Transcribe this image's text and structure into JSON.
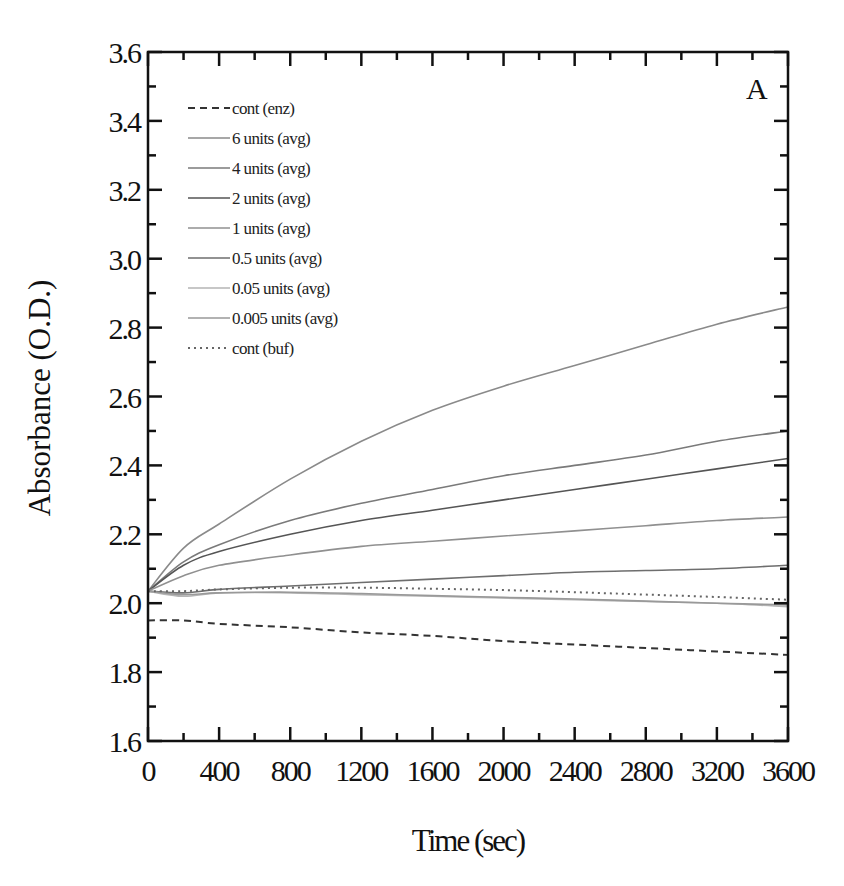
{
  "chart_data": {
    "type": "line",
    "title": "",
    "panel_label": "A",
    "xlabel": "Time (sec)",
    "ylabel": "Absorbance (O.D.)",
    "xlim": [
      0,
      3600
    ],
    "ylim": [
      1.6,
      3.6
    ],
    "xticks": [
      0,
      400,
      800,
      1200,
      1600,
      2000,
      2400,
      2800,
      3200,
      3600
    ],
    "xminor": [
      200,
      600,
      1000,
      1400,
      1800,
      2200,
      2600,
      3000,
      3400
    ],
    "yticks": [
      1.6,
      1.8,
      2.0,
      2.2,
      2.4,
      2.6,
      2.8,
      3.0,
      3.2,
      3.4,
      3.6
    ],
    "yticklabels": [
      "1.6",
      "1.8",
      "2.0",
      "2.2",
      "2.4",
      "2.6",
      "2.8",
      "3.0",
      "3.2",
      "3.4",
      "3.6"
    ],
    "yminor": [
      1.7,
      1.9,
      2.1,
      2.3,
      2.5,
      2.7,
      2.9,
      3.1,
      3.3,
      3.5
    ],
    "grid": false,
    "legend_position": "upper left",
    "x": [
      0,
      200,
      400,
      800,
      1200,
      1600,
      2000,
      2400,
      2800,
      3200,
      3600
    ],
    "series": [
      {
        "name": "cont (enz)",
        "style": "dashed",
        "color": "#333333",
        "values": [
          1.95,
          1.95,
          1.94,
          1.93,
          1.915,
          1.905,
          1.89,
          1.88,
          1.87,
          1.86,
          1.85
        ]
      },
      {
        "name": "6 units (avg)",
        "style": "solid",
        "color": "#8a8a8a",
        "values": [
          2.035,
          2.16,
          2.23,
          2.36,
          2.47,
          2.56,
          2.63,
          2.69,
          2.75,
          2.81,
          2.86
        ]
      },
      {
        "name": "4 units (avg)",
        "style": "solid",
        "color": "#7a7a7a",
        "values": [
          2.035,
          2.12,
          2.17,
          2.24,
          2.29,
          2.33,
          2.37,
          2.4,
          2.43,
          2.47,
          2.5
        ]
      },
      {
        "name": "2 units (avg)",
        "style": "solid",
        "color": "#555555",
        "values": [
          2.035,
          2.11,
          2.15,
          2.2,
          2.24,
          2.27,
          2.3,
          2.33,
          2.36,
          2.39,
          2.42
        ]
      },
      {
        "name": "1 units (avg)",
        "style": "solid",
        "color": "#909090",
        "values": [
          2.035,
          2.08,
          2.11,
          2.14,
          2.165,
          2.18,
          2.195,
          2.21,
          2.225,
          2.24,
          2.25
        ]
      },
      {
        "name": "0.5 units (avg)",
        "style": "solid",
        "color": "#6e6e6e",
        "values": [
          2.035,
          2.03,
          2.04,
          2.05,
          2.06,
          2.07,
          2.08,
          2.09,
          2.095,
          2.1,
          2.11
        ]
      },
      {
        "name": "0.05 units (avg)",
        "style": "solid",
        "color": "#b5b5b5",
        "values": [
          2.035,
          2.02,
          2.03,
          2.03,
          2.025,
          2.02,
          2.015,
          2.01,
          2.005,
          2.0,
          1.99
        ]
      },
      {
        "name": "0.005 units (avg)",
        "style": "solid",
        "color": "#999999",
        "values": [
          2.035,
          2.025,
          2.03,
          2.032,
          2.028,
          2.022,
          2.017,
          2.012,
          2.006,
          2.0,
          1.995
        ]
      },
      {
        "name": "cont (buf)",
        "style": "dotted",
        "color": "#666666",
        "values": [
          2.035,
          2.035,
          2.04,
          2.045,
          2.045,
          2.042,
          2.038,
          2.032,
          2.025,
          2.018,
          2.01
        ]
      }
    ]
  }
}
